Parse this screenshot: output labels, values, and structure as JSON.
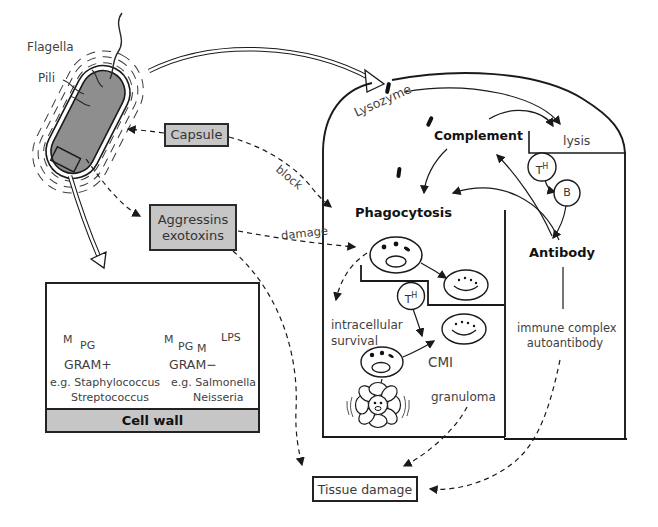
{
  "figure": {
    "bacterium": {
      "flagella": "Flagella",
      "pili": "Pili"
    },
    "virulence": {
      "capsule": "Capsule",
      "aggressins_line1": "Aggressins",
      "aggressins_line2": "exotoxins",
      "block_label": "block",
      "damage_label": "damage"
    },
    "host": {
      "lysozyme": "Lysozyme",
      "complement": "Complement",
      "lysis": "lysis",
      "phagocytosis": "Phagocytosis",
      "antibody": "Antibody",
      "t_helper": "T",
      "t_helper_sup": "H",
      "b_cell": "B",
      "intracellular_line1": "intracellular",
      "intracellular_line2": "survival",
      "cmi": "CMI",
      "granuloma": "granuloma",
      "immune_complex_line1": "immune complex",
      "immune_complex_line2": "autoantibody"
    },
    "outcome": {
      "tissue_damage": "Tissue damage"
    },
    "cell_wall_panel": {
      "title": "Cell wall",
      "gram_positive": {
        "label": "GRAM+",
        "example_line1": "e.g. Staphylococcus",
        "example_line2": "Streptococcus",
        "m": "M",
        "pg": "PG"
      },
      "gram_negative": {
        "label": "GRAM−",
        "example_line1": "e.g. Salmonella",
        "example_line2": "Neisseria",
        "m_outer": "M",
        "pg": "PG",
        "m_inner": "M",
        "lps": "LPS"
      }
    },
    "colors": {
      "box_fill": "#c6c6c6",
      "bacterium_fill": "#8e8e8e",
      "ink": "#1a1a1a",
      "hand_text": "#3f3f3f"
    }
  }
}
